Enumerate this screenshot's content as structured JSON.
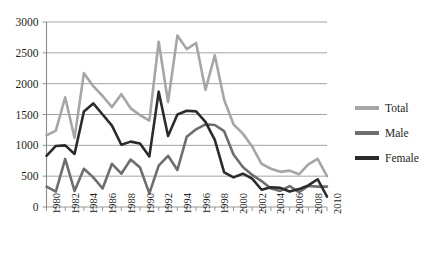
{
  "chart_data": {
    "type": "line",
    "title": "",
    "subtitle": "",
    "xlabel": "",
    "ylabel": "",
    "x": [
      1980,
      1981,
      1982,
      1983,
      1984,
      1985,
      1986,
      1987,
      1988,
      1989,
      1990,
      1991,
      1992,
      1993,
      1994,
      1995,
      1996,
      1997,
      1998,
      1999,
      2000,
      2001,
      2002,
      2003,
      2004,
      2005,
      2006,
      2007,
      2008,
      2009,
      2010
    ],
    "xlim": [
      1980,
      2010
    ],
    "ylim": [
      0,
      3000
    ],
    "yticks": [
      0,
      500,
      1000,
      1500,
      2000,
      2500,
      3000
    ],
    "xtick_labels": [
      "1980",
      "1982",
      "1984",
      "1986",
      "1988",
      "1990",
      "1992",
      "1994",
      "1996",
      "1998",
      "2000",
      "2002",
      "2004",
      "2006",
      "2008",
      "2010"
    ],
    "xtick_interval": 2,
    "minor_xticks_every": 1,
    "grid": "horizontal",
    "legend_position": "right",
    "series": [
      {
        "name": "Total",
        "color": "#a6a6a6",
        "values": [
          1160,
          1240,
          1780,
          1120,
          2170,
          1960,
          1800,
          1620,
          1830,
          1600,
          1490,
          1400,
          2680,
          1700,
          2780,
          2560,
          2660,
          1900,
          2460,
          1740,
          1340,
          1190,
          980,
          700,
          620,
          570,
          590,
          530,
          690,
          780,
          500
        ]
      },
      {
        "name": "Male",
        "color": "#6e6e6e",
        "values": [
          330,
          250,
          780,
          260,
          620,
          480,
          300,
          700,
          540,
          770,
          640,
          220,
          670,
          830,
          600,
          1140,
          1260,
          1340,
          1330,
          1230,
          850,
          650,
          520,
          420,
          300,
          260,
          340,
          240,
          340,
          330,
          330
        ]
      },
      {
        "name": "Female",
        "color": "#2b2b2b",
        "values": [
          830,
          990,
          1000,
          860,
          1550,
          1680,
          1500,
          1320,
          1010,
          1060,
          1030,
          820,
          1870,
          1150,
          1500,
          1560,
          1550,
          1380,
          1090,
          560,
          480,
          540,
          460,
          280,
          320,
          310,
          250,
          290,
          350,
          450,
          170
        ]
      }
    ],
    "legend": [
      {
        "label": "Total",
        "color": "#a6a6a6"
      },
      {
        "label": "Male",
        "color": "#6e6e6e"
      },
      {
        "label": "Female",
        "color": "#2b2b2b"
      }
    ],
    "axis_color": "#8a8a8a",
    "grid_color": "#9a9a9a",
    "text_color": "#231f20",
    "background": "#ffffff"
  }
}
